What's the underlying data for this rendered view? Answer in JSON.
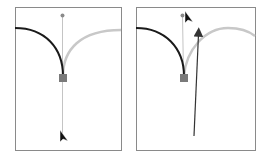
{
  "diagram": {
    "panels": [
      {
        "id": "before",
        "frame": {
          "x": 15,
          "y": 7,
          "w": 106,
          "h": 143
        },
        "anchor": {
          "x": 63,
          "y": 78
        },
        "handle_top": {
          "x": 62,
          "y": 15
        },
        "handle_bottom": {
          "x": 63,
          "y": 140
        },
        "cursor": {
          "x": 60,
          "y": 133
        }
      },
      {
        "id": "after",
        "frame": {
          "x": 136,
          "y": 7,
          "w": 119,
          "h": 143
        },
        "anchor": {
          "x": 184,
          "y": 78
        },
        "handle_top": {
          "x": 182,
          "y": 15
        },
        "cursor": {
          "x": 185,
          "y": 14
        },
        "drag_arrow": {
          "from": {
            "x": 194,
            "y": 136
          },
          "to": {
            "x": 199,
            "y": 28
          }
        }
      }
    ],
    "colors": {
      "frame": "#8a8a8a",
      "active_curve": "#1a1a1a",
      "inactive_curve": "#c8c8c8",
      "handle_line": "#bdbdbd",
      "anchor": "#7a7a7a",
      "handle_dot": "#8a8a8a",
      "cursor": "#111111",
      "arrow": "#333333"
    }
  }
}
